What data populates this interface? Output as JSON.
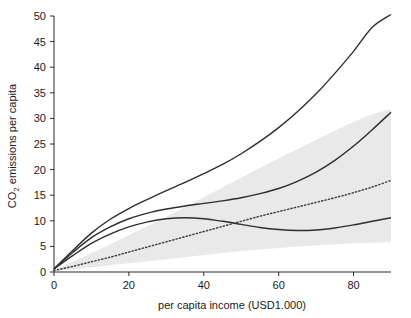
{
  "chart_data": {
    "type": "line",
    "title": "",
    "xlabel": "per capita income (USD1.000)",
    "ylabel": "CO2 emissions per capita",
    "ylabel_main": "CO",
    "ylabel_sub": "2",
    "ylabel_rest": " emissions per capita",
    "xlim": [
      0,
      90
    ],
    "ylim": [
      0,
      50
    ],
    "xticks": [
      0,
      20,
      40,
      60,
      80
    ],
    "xtick_labels": [
      "0",
      "20",
      "40",
      "60",
      "80"
    ],
    "yticks": [
      0,
      5,
      10,
      15,
      20,
      25,
      30,
      35,
      40,
      45,
      50
    ],
    "ytick_labels": [
      "0",
      "5",
      "10",
      "15",
      "20",
      "25",
      "30",
      "35",
      "40",
      "45",
      "50"
    ],
    "grid": false,
    "legend": "none",
    "x": [
      0,
      5,
      10,
      15,
      20,
      25,
      30,
      35,
      40,
      45,
      50,
      55,
      60,
      65,
      70,
      75,
      80,
      85,
      90
    ],
    "series": [
      {
        "name": "upper curve",
        "style": "solid",
        "color": "#2e2e2e",
        "values": [
          0.6,
          4.2,
          7.6,
          10.3,
          12.4,
          14.2,
          15.9,
          17.5,
          19.2,
          21.0,
          23.1,
          25.5,
          28.2,
          31.3,
          34.8,
          38.8,
          43.1,
          47.8,
          50.3
        ]
      },
      {
        "name": "second curve",
        "style": "solid",
        "color": "#2e2e2e",
        "values": [
          0.6,
          3.8,
          6.7,
          8.8,
          10.4,
          11.5,
          12.3,
          12.9,
          13.4,
          13.9,
          14.5,
          15.3,
          16.3,
          17.7,
          19.5,
          21.8,
          24.6,
          27.8,
          31.2
        ]
      },
      {
        "name": "third curve",
        "style": "solid",
        "color": "#2e2e2e",
        "values": [
          0.6,
          3.2,
          5.6,
          7.4,
          8.8,
          9.8,
          10.4,
          10.6,
          10.4,
          9.9,
          9.3,
          8.7,
          8.3,
          8.1,
          8.2,
          8.6,
          9.2,
          9.9,
          10.6
        ]
      },
      {
        "name": "dotted trend",
        "style": "dotted",
        "color": "#3a3a3a",
        "values": [
          0.3,
          1.1,
          2.0,
          2.9,
          3.9,
          4.9,
          5.9,
          6.9,
          7.9,
          8.9,
          9.9,
          10.9,
          11.8,
          12.7,
          13.6,
          14.5,
          15.5,
          16.6,
          17.9
        ]
      }
    ],
    "band": {
      "name": "confidence band",
      "color": "#e9e9e9",
      "upper": [
        0.4,
        2.0,
        3.7,
        5.4,
        7.2,
        9.0,
        10.8,
        12.7,
        14.6,
        16.5,
        18.4,
        20.3,
        22.2,
        24.0,
        25.8,
        27.6,
        29.3,
        30.8,
        31.8
      ],
      "lower": [
        0.2,
        0.5,
        0.9,
        1.3,
        1.7,
        2.1,
        2.5,
        2.9,
        3.3,
        3.7,
        4.1,
        4.4,
        4.7,
        5.0,
        5.2,
        5.4,
        5.6,
        5.7,
        5.8
      ]
    }
  }
}
